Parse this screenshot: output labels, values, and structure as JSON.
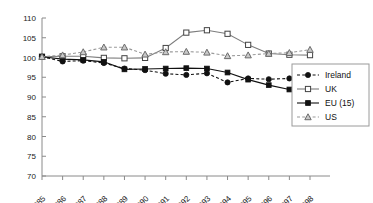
{
  "chart_data": {
    "type": "line",
    "title": "",
    "xlabel": "",
    "ylabel": "",
    "categories": [
      "1985",
      "1986",
      "1987",
      "1988",
      "1989",
      "1990",
      "1991",
      "1992",
      "1993",
      "1994",
      "1995",
      "1996",
      "1997",
      "1998"
    ],
    "ylim": [
      70,
      110
    ],
    "yticks": [
      70,
      75,
      80,
      85,
      90,
      95,
      100,
      105,
      110
    ],
    "grid": false,
    "legend_position": "right-bottom",
    "series": [
      {
        "name": "Ireland",
        "marker": "filled-circle",
        "line": "dashed",
        "values": [
          100.2,
          99.0,
          99.2,
          98.6,
          97.2,
          96.8,
          95.9,
          95.6,
          96.0,
          93.7,
          94.7,
          94.5,
          94.7,
          95.1
        ]
      },
      {
        "name": "UK",
        "marker": "open-square",
        "line": "solid",
        "values": [
          100.2,
          100.3,
          100.3,
          99.9,
          99.8,
          99.9,
          102.4,
          106.3,
          106.9,
          106.0,
          103.2,
          101.0,
          100.7,
          100.6
        ]
      },
      {
        "name": "EU (15)",
        "marker": "filled-square",
        "line": "solid",
        "values": [
          100.2,
          99.6,
          99.4,
          98.9,
          97.0,
          97.1,
          97.2,
          97.3,
          97.2,
          96.2,
          94.4,
          93.0,
          91.9,
          90.8
        ]
      },
      {
        "name": "US",
        "marker": "open-triangle",
        "line": "dashed",
        "values": [
          100.2,
          100.6,
          101.4,
          102.6,
          102.6,
          100.8,
          101.4,
          101.5,
          101.3,
          100.4,
          100.6,
          101.0,
          101.2,
          102.0
        ]
      }
    ]
  },
  "legend": {
    "items": [
      {
        "label": "Ireland"
      },
      {
        "label": "UK"
      },
      {
        "label": "EU (15)"
      },
      {
        "label": "US"
      }
    ]
  }
}
